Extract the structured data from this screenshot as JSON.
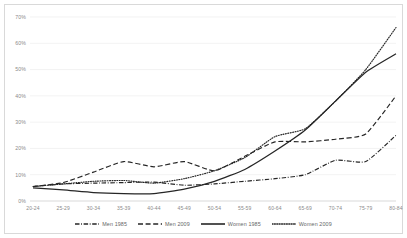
{
  "chart_data": {
    "type": "line",
    "title": "",
    "subtitle": "",
    "xlabel": "",
    "ylabel": "",
    "grid": true,
    "legend_position": "bottom",
    "ylim": [
      0,
      70
    ],
    "ytick_labels": [
      "0%",
      "10%",
      "20%",
      "30%",
      "40%",
      "50%",
      "60%",
      "70%"
    ],
    "ytick_values": [
      0,
      10,
      20,
      30,
      40,
      50,
      60,
      70
    ],
    "categories": [
      "20-24",
      "25-29",
      "30-34",
      "35-39",
      "40-44",
      "45-49",
      "50-54",
      "55-59",
      "60-64",
      "65-69",
      "70-74",
      "75-79",
      "80-84"
    ],
    "series": [
      {
        "name": "Men 1985",
        "style": "dash-dot",
        "color": "#262626",
        "values": [
          5.5,
          6.5,
          6.8,
          7.0,
          7.2,
          6.0,
          6.5,
          7.5,
          8.5,
          10.0,
          15.5,
          15.0,
          25.0
        ]
      },
      {
        "name": "Men 2009",
        "style": "dashed",
        "color": "#262626",
        "values": [
          5.5,
          7.0,
          11.0,
          15.0,
          13.0,
          15.0,
          11.5,
          17.0,
          22.5,
          22.5,
          23.5,
          25.5,
          40.0
        ]
      },
      {
        "name": "Women 1985",
        "style": "solid",
        "color": "#262626",
        "values": [
          5.0,
          4.2,
          3.2,
          2.8,
          2.8,
          4.5,
          7.5,
          12.0,
          19.0,
          27.0,
          38.0,
          49.0,
          56.0
        ]
      },
      {
        "name": "Women 2009",
        "style": "dotted",
        "color": "#262626",
        "values": [
          5.5,
          6.5,
          7.5,
          7.8,
          6.8,
          8.5,
          11.5,
          16.5,
          24.5,
          27.5,
          38.0,
          50.0,
          66.0
        ]
      }
    ]
  },
  "legend": {
    "items": [
      {
        "label": "Men 1985",
        "style": "dash-dot"
      },
      {
        "label": "Men 2009",
        "style": "dashed"
      },
      {
        "label": "Women 1985",
        "style": "solid"
      },
      {
        "label": "Women 2009",
        "style": "dotted"
      }
    ]
  }
}
